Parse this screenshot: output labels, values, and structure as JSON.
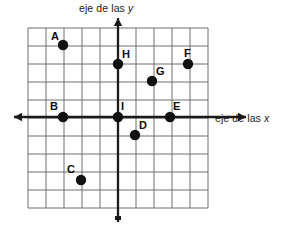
{
  "figure": {
    "type": "coordinate-plane",
    "language": "es",
    "background_color": "#ffffff",
    "grid_color": "#6e6e6e",
    "axis_color": "#1a1a1a",
    "point_color": "#111111"
  },
  "axes": {
    "x_label": "eje de las ",
    "x_variable": "x",
    "y_label": "eje de las ",
    "y_variable": "y",
    "origin_px": {
      "x": 118,
      "y": 117
    },
    "cell_px": 18,
    "x_range": [
      -5,
      5
    ],
    "y_range": [
      -5,
      5
    ],
    "grid": "on",
    "tick_labels": "none"
  },
  "grid": {
    "left_px": 28,
    "top_px": 28,
    "width_px": 180,
    "height_px": 180,
    "columns": 10,
    "rows": 10
  },
  "chart_data": {
    "type": "scatter",
    "title": "",
    "xlabel": "eje de las x",
    "ylabel": "eje de las y",
    "xlim": [
      -5,
      5
    ],
    "ylim": [
      -5,
      5
    ],
    "grid": "on",
    "legend": "none",
    "labels": [
      "A",
      "B",
      "C",
      "D",
      "E",
      "F",
      "G",
      "H",
      "I"
    ],
    "x": [
      -3,
      -3,
      -2,
      1,
      3,
      4,
      2,
      0,
      0
    ],
    "y": [
      4,
      0,
      -3.5,
      -1,
      0,
      3,
      2,
      3,
      0
    ],
    "points": [
      {
        "label": "A",
        "x": -3,
        "y": 4,
        "px": 63,
        "py": 45,
        "label_dx": -12,
        "label_dy": -14
      },
      {
        "label": "B",
        "x": -3,
        "y": 0,
        "px": 63,
        "py": 117,
        "label_dx": -13,
        "label_dy": -16
      },
      {
        "label": "C",
        "x": -2,
        "y": -3.5,
        "px": 81,
        "py": 180,
        "label_dx": -14,
        "label_dy": -16
      },
      {
        "label": "D",
        "x": 1,
        "y": -1,
        "px": 135,
        "py": 135,
        "label_dx": 4,
        "label_dy": -15
      },
      {
        "label": "E",
        "x": 3,
        "y": 0,
        "px": 170,
        "py": 117,
        "label_dx": 3,
        "label_dy": -16
      },
      {
        "label": "F",
        "x": 4,
        "y": 3,
        "px": 188,
        "py": 64,
        "label_dx": -4,
        "label_dy": -16
      },
      {
        "label": "G",
        "x": 2,
        "y": 2,
        "px": 152,
        "py": 81,
        "label_dx": 4,
        "label_dy": -15
      },
      {
        "label": "H",
        "x": 0,
        "y": 3,
        "px": 118,
        "py": 64,
        "label_dx": 4,
        "label_dy": -15
      },
      {
        "label": "I",
        "x": 0,
        "y": 0,
        "px": 118,
        "py": 117,
        "label_dx": 3,
        "label_dy": -16
      }
    ]
  }
}
